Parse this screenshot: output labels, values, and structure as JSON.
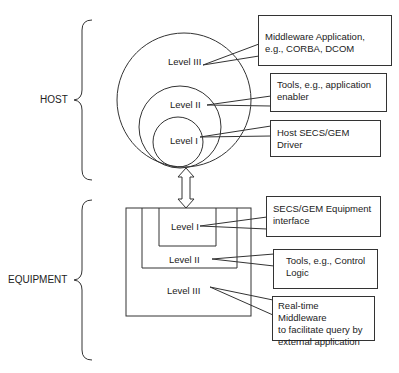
{
  "groups": {
    "host": "HOST",
    "equipment": "EQUIPMENT"
  },
  "host_levels": {
    "level3": "Level III",
    "level2": "Level II",
    "level1": "Level I"
  },
  "equipment_levels": {
    "level1": "Level I",
    "level2": "Level II",
    "level3": "Level III"
  },
  "callouts": {
    "host_level3": {
      "line1": "Middleware Application,",
      "line2": "e.g., CORBA, DCOM"
    },
    "host_level2": {
      "line1": "Tools, e.g., application",
      "line2": "enabler"
    },
    "host_level1": {
      "line1": "Host SECS/GEM",
      "line2": "Driver"
    },
    "equip_level1": {
      "line1": "SECS/GEM Equipment",
      "line2": "interface"
    },
    "equip_level2": {
      "line1": "Tools, e.g., Control",
      "line2": "Logic"
    },
    "equip_level3": {
      "line1": "Real-time Middleware",
      "line2": "to facilitate query by",
      "line3": "external application"
    }
  },
  "colors": {
    "stroke": "#333333",
    "text": "#222222",
    "background": "#ffffff"
  }
}
